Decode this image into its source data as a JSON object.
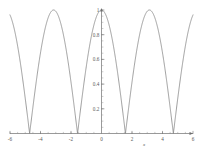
{
  "chart_data": {
    "type": "line",
    "title": "",
    "subtitle": "",
    "xlabel": "x",
    "ylabel": "",
    "expression": "abs(cos(x))",
    "xlim": [
      -6,
      6
    ],
    "ylim": [
      0,
      1
    ],
    "grid": false,
    "legend": null,
    "legend_position": "none",
    "x_ticks": [
      -6,
      -4,
      -2,
      0,
      2,
      4,
      6
    ],
    "x_tick_labels": [
      "-6",
      "-4",
      "-2",
      "0",
      "2",
      "4",
      "6"
    ],
    "x_minor_tick_step": 0.5,
    "y_ticks": [
      0.2,
      0.4,
      0.6,
      0.8,
      1
    ],
    "y_tick_labels": [
      "0.2",
      "0.4",
      "0.6",
      "0.8",
      "1"
    ],
    "y_minor_tick_step": 0.05,
    "maxima_x": [
      -6.283,
      -3.142,
      0,
      3.142,
      6.283
    ],
    "maxima_y": 1,
    "minima_x": [
      -4.712,
      -1.571,
      1.571,
      4.712
    ],
    "minima_y": 0,
    "series": [
      {
        "name": "abs(cos(x))",
        "color": "#7d7d7d",
        "x": [
          -6,
          -5.75,
          -5.5,
          -5.25,
          -5,
          -4.75,
          -4.712,
          -4.5,
          -4.25,
          -4,
          -3.75,
          -3.5,
          -3.25,
          -3.142,
          -3,
          -2.75,
          -2.5,
          -2.25,
          -2,
          -1.75,
          -1.571,
          -1.5,
          -1.25,
          -1,
          -0.75,
          -0.5,
          -0.25,
          0,
          0.25,
          0.5,
          0.75,
          1,
          1.25,
          1.5,
          1.571,
          1.75,
          2,
          2.25,
          2.5,
          2.75,
          3,
          3.142,
          3.25,
          3.5,
          3.75,
          4,
          4.25,
          4.5,
          4.712,
          4.75,
          5,
          5.25,
          5.5,
          5.75,
          6
        ],
        "y": [
          0.96,
          0.854,
          0.708,
          0.531,
          0.284,
          0.037,
          0,
          0.211,
          0.447,
          0.654,
          0.821,
          0.936,
          0.994,
          1,
          0.99,
          0.924,
          0.801,
          0.628,
          0.416,
          0.178,
          0,
          0.071,
          0.315,
          0.54,
          0.732,
          0.878,
          0.969,
          1,
          0.969,
          0.878,
          0.732,
          0.54,
          0.315,
          0.071,
          0,
          0.178,
          0.416,
          0.628,
          0.801,
          0.924,
          0.99,
          1,
          0.994,
          0.936,
          0.821,
          0.654,
          0.447,
          0.211,
          0,
          0.037,
          0.284,
          0.531,
          0.708,
          0.854,
          0.96
        ]
      }
    ],
    "axis_color": "#6e6e6e",
    "background": "#ffffff"
  },
  "axes": {
    "x_axis_name": "x",
    "y_axis_name": ""
  }
}
